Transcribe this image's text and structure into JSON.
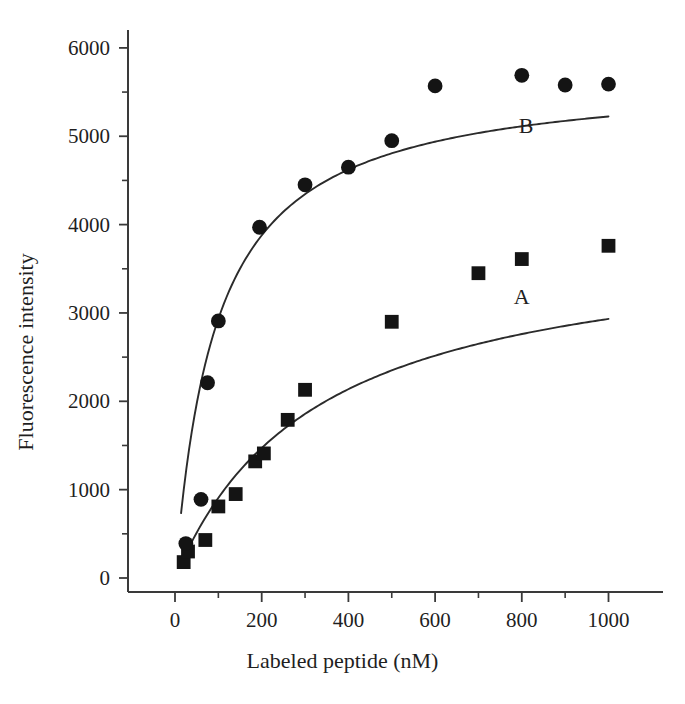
{
  "chart_data": {
    "type": "scatter",
    "title": "",
    "xlabel": "Labeled peptide (nM)",
    "ylabel": "Fluorescence intensity",
    "xlim": [
      -40,
      1080
    ],
    "ylim": [
      -150,
      6250
    ],
    "xticks": [
      0,
      200,
      400,
      600,
      800,
      1000
    ],
    "xtick_labels": [
      "0",
      "200",
      "400",
      "600",
      "800",
      "1000"
    ],
    "x_minor_ticks": [
      100,
      300,
      500,
      700,
      900
    ],
    "yticks": [
      0,
      1000,
      2000,
      3000,
      4000,
      5000,
      6000
    ],
    "ytick_labels": [
      "0",
      "1000",
      "2000",
      "3000",
      "4000",
      "5000",
      "6000"
    ],
    "y_minor_ticks": [
      500,
      1500,
      2500,
      3500,
      4500,
      5500
    ],
    "grid": false,
    "legend_position": "inline-annotation",
    "marker_color": "#141414",
    "line_color": "#2b2b2b",
    "series": [
      {
        "name": "A",
        "marker": "square",
        "label_x": 800,
        "label_y": 3180,
        "points": [
          {
            "x": 20,
            "y": 180
          },
          {
            "x": 30,
            "y": 300
          },
          {
            "x": 70,
            "y": 430
          },
          {
            "x": 100,
            "y": 810
          },
          {
            "x": 140,
            "y": 950
          },
          {
            "x": 185,
            "y": 1320
          },
          {
            "x": 205,
            "y": 1410
          },
          {
            "x": 260,
            "y": 1790
          },
          {
            "x": 300,
            "y": 2130
          },
          {
            "x": 500,
            "y": 2900
          },
          {
            "x": 700,
            "y": 3450
          },
          {
            "x": 800,
            "y": 3610
          },
          {
            "x": 1000,
            "y": 3760
          }
        ],
        "fit_plateau": 3900,
        "fit_kd": 330
      },
      {
        "name": "B",
        "marker": "circle",
        "label_x": 810,
        "label_y": 5120,
        "points": [
          {
            "x": 25,
            "y": 390
          },
          {
            "x": 60,
            "y": 890
          },
          {
            "x": 75,
            "y": 2210
          },
          {
            "x": 100,
            "y": 2910
          },
          {
            "x": 195,
            "y": 3970
          },
          {
            "x": 300,
            "y": 4450
          },
          {
            "x": 400,
            "y": 4650
          },
          {
            "x": 500,
            "y": 4950
          },
          {
            "x": 600,
            "y": 5570
          },
          {
            "x": 800,
            "y": 5690
          },
          {
            "x": 900,
            "y": 5580
          },
          {
            "x": 1000,
            "y": 5590
          }
        ],
        "fit_plateau": 5720,
        "fit_kd": 95
      }
    ]
  }
}
